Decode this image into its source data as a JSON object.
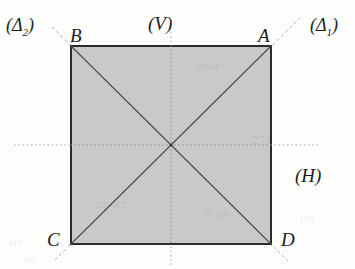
{
  "figure": {
    "background_color": "#fdfdfc",
    "square": {
      "fill_color": "#c9c9c9",
      "stroke_color": "#2b2b2b",
      "stroke_width": 2,
      "left": 70,
      "top": 45,
      "right": 272,
      "bottom": 245
    },
    "center": {
      "x": 171,
      "y": 145
    },
    "vertices": [
      {
        "name": "A",
        "label": "A",
        "position": "top-right",
        "x": 272,
        "y": 45,
        "label_x": 258,
        "label_y": 26
      },
      {
        "name": "B",
        "label": "B",
        "position": "top-left",
        "x": 70,
        "y": 45,
        "label_x": 70,
        "label_y": 26
      },
      {
        "name": "C",
        "label": "C",
        "position": "bottom-left",
        "x": 70,
        "y": 245,
        "label_x": 47,
        "label_y": 230
      },
      {
        "name": "D",
        "label": "D",
        "position": "bottom-right",
        "x": 272,
        "y": 245,
        "label_x": 281,
        "label_y": 230
      }
    ],
    "axes": [
      {
        "name": "vertical-axis",
        "label": "(V)",
        "label_x": 148,
        "label_y": 14,
        "style": "dotted",
        "color": "#a6a6a6",
        "x1": 171,
        "y1": 28,
        "x2": 171,
        "y2": 266
      },
      {
        "name": "horizontal-axis",
        "label": "(H)",
        "label_x": 295,
        "label_y": 166,
        "style": "dotted",
        "color": "#a6a6a6",
        "x1": 14,
        "y1": 145,
        "x2": 318,
        "y2": 145
      }
    ],
    "diagonals": [
      {
        "name": "delta-1",
        "label": "(Δ1)",
        "label_text": "(Δ",
        "label_sub": "1",
        "label_close": ")",
        "label_x": 310,
        "label_y": 16,
        "from": "C",
        "to": "A",
        "x1": 70,
        "y1": 245,
        "x2": 272,
        "y2": 45,
        "color": "#4a4a4a",
        "extension_color": "#b0b0b0",
        "ext_x1": 55,
        "ext_y1": 260,
        "ext_x2": 300,
        "ext_y2": 18
      },
      {
        "name": "delta-2",
        "label": "(Δ2)",
        "label_text": "(Δ",
        "label_sub": "2",
        "label_close": ")",
        "label_x": 6,
        "label_y": 16,
        "from": "B",
        "to": "D",
        "x1": 70,
        "y1": 45,
        "x2": 272,
        "y2": 245,
        "color": "#4a4a4a",
        "extension_color": "#b0b0b0",
        "ext_x1": 52,
        "ext_y1": 27,
        "ext_x2": 288,
        "ext_y2": 261
      }
    ],
    "background_artifacts": [
      {
        "text": "диаг",
        "x": 196,
        "y": 58,
        "size": 13,
        "opacity": 0.05
      },
      {
        "text": "274",
        "x": 252,
        "y": 132,
        "size": 13,
        "opacity": 0.05
      },
      {
        "text": "прост",
        "x": 96,
        "y": 196,
        "size": 13,
        "opacity": 0.05
      },
      {
        "text": "В сл",
        "x": 204,
        "y": 206,
        "size": 13,
        "opacity": 0.05
      },
      {
        "text": "но",
        "x": 300,
        "y": 210,
        "size": 13,
        "opacity": 0.05
      },
      {
        "text": "из",
        "x": 10,
        "y": 234,
        "size": 13,
        "opacity": 0.05
      },
      {
        "text": "на",
        "x": 24,
        "y": 252,
        "size": 12,
        "opacity": 0.045
      }
    ]
  }
}
